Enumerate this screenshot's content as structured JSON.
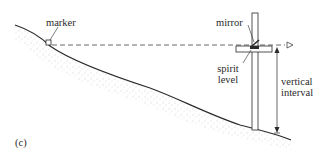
{
  "diagram": {
    "panel_label": "(c)",
    "labels": {
      "marker": "marker",
      "mirror": "mirror",
      "spirit_level_line1": "spirit",
      "spirit_level_line2": "level",
      "vertical_interval_line1": "vertical",
      "vertical_interval_line2": "interval"
    },
    "colors": {
      "line": "#2a2a2a",
      "stipple": "#9a9a9a",
      "background": "#ffffff"
    }
  }
}
